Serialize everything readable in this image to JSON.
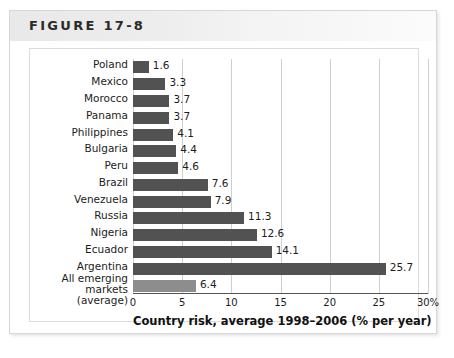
{
  "figure": {
    "title": "FIGURE 17-8"
  },
  "chart_data": {
    "type": "bar",
    "orientation": "horizontal",
    "title": "",
    "xlabel": "Country risk, average 1998–2006 (% per year)",
    "ylabel": "",
    "xlim": [
      0,
      30
    ],
    "xticks": [
      0,
      5,
      10,
      15,
      20,
      25,
      30
    ],
    "xtick_labels": [
      "0",
      "5",
      "10",
      "15",
      "20",
      "25",
      "30%"
    ],
    "grid": true,
    "legend": "none",
    "categories": [
      "Poland",
      "Mexico",
      "Morocco",
      "Panama",
      "Philippines",
      "Bulgaria",
      "Peru",
      "Brazil",
      "Venezuela",
      "Russia",
      "Nigeria",
      "Ecuador",
      "Argentina",
      "All emerging markets (average)"
    ],
    "values": [
      1.6,
      3.3,
      3.7,
      3.7,
      4.1,
      4.4,
      4.6,
      7.6,
      7.9,
      11.3,
      12.6,
      14.1,
      25.7,
      6.4
    ],
    "value_labels": [
      "1.6",
      "3.3",
      "3.7",
      "3.7",
      "4.1",
      "4.4",
      "4.6",
      "7.6",
      "7.9",
      "11.3",
      "12.6",
      "14.1",
      "25.7",
      "6.4"
    ],
    "bar_color": "#525252",
    "highlight_bar_color": "#8d8d8d",
    "highlight_index": 13,
    "gridline_color": "#cfcfcf",
    "axis_color": "#555555"
  }
}
